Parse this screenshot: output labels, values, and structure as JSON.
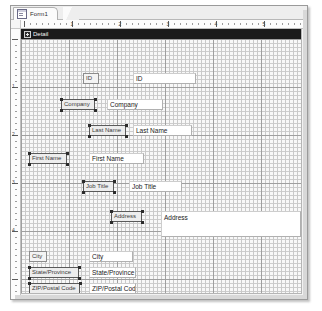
{
  "window": {
    "tab_label": "Form1",
    "tab_icon": "form-design-icon"
  },
  "section": {
    "label": "Detail",
    "expander_icon": "expand-plus-icon"
  },
  "rulers": {
    "horizontal_numbers": [
      "1",
      "2",
      "3",
      "4",
      "5"
    ],
    "vertical_numbers": [
      "1",
      "2",
      "3",
      "4"
    ],
    "units": "inches"
  },
  "form_controls": [
    {
      "name": "id",
      "label": "ID",
      "label_x": 62,
      "label_y": 44,
      "label_w": 16,
      "value": "ID",
      "box_x": 112,
      "box_y": 44,
      "box_w": 63,
      "multiline": false,
      "selected": false
    },
    {
      "name": "company",
      "label": "Company",
      "label_x": 40,
      "label_y": 70,
      "label_w": 34,
      "value": "Company",
      "box_x": 86,
      "box_y": 70,
      "box_w": 56,
      "multiline": false,
      "selected": true
    },
    {
      "name": "last-name",
      "label": "Last Name",
      "label_x": 68,
      "label_y": 96,
      "label_w": 37,
      "value": "Last Name",
      "box_x": 112,
      "box_y": 96,
      "box_w": 59,
      "multiline": false,
      "selected": true
    },
    {
      "name": "first-name",
      "label": "First Name",
      "label_x": 8,
      "label_y": 124,
      "label_w": 38,
      "value": "First Name",
      "box_x": 68,
      "box_y": 124,
      "box_w": 55,
      "multiline": false,
      "selected": true
    },
    {
      "name": "job-title",
      "label": "Job Title",
      "label_x": 62,
      "label_y": 152,
      "label_w": 31,
      "value": "Job Title",
      "box_x": 108,
      "box_y": 152,
      "box_w": 53,
      "multiline": false,
      "selected": true
    },
    {
      "name": "address",
      "label": "Address",
      "label_x": 90,
      "label_y": 182,
      "label_w": 31,
      "value": "Address",
      "box_x": 140,
      "box_y": 182,
      "box_w": 140,
      "multiline": true,
      "selected": true
    },
    {
      "name": "city",
      "label": "City",
      "label_x": 8,
      "label_y": 222,
      "label_w": 18,
      "value": "City",
      "box_x": 68,
      "box_y": 222,
      "box_w": 44,
      "multiline": false,
      "selected": false
    },
    {
      "name": "state-province",
      "label": "State/Province",
      "label_x": 8,
      "label_y": 238,
      "label_w": 50,
      "value": "State/Province",
      "box_x": 68,
      "box_y": 238,
      "box_w": 47,
      "multiline": false,
      "selected": true
    },
    {
      "name": "zip-postal-code",
      "label": "ZIP/Postal Code",
      "label_x": 8,
      "label_y": 254,
      "label_w": 51,
      "value": "ZIP/Postal Code",
      "box_x": 68,
      "box_y": 254,
      "box_w": 47,
      "multiline": false,
      "selected": true
    }
  ]
}
